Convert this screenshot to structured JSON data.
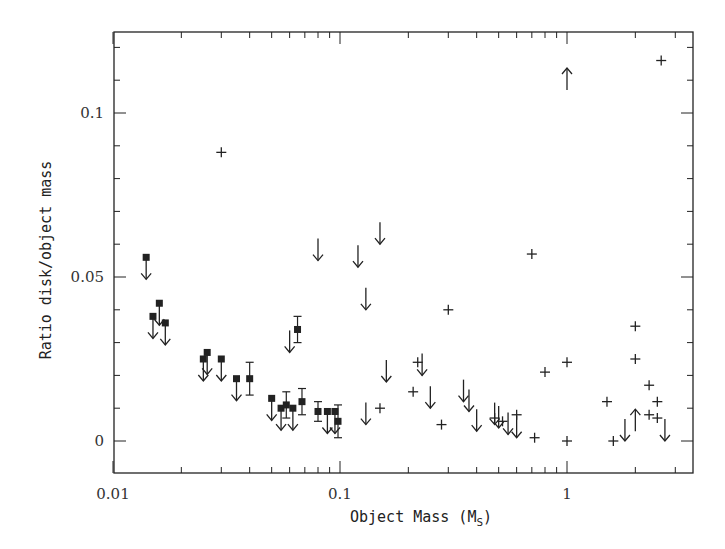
{
  "chart_data": {
    "type": "scatter",
    "title": "",
    "xlabel": "Object Mass (M_S)",
    "ylabel": "Ratio disk/object mass",
    "xscale": "log",
    "xlim": [
      0.01,
      3.6
    ],
    "ylim": [
      -0.01,
      0.125
    ],
    "grid": false,
    "legend": null,
    "x_ticks": [
      "0.01",
      "0.1",
      "1"
    ],
    "y_ticks": [
      "0",
      "0.05",
      "0.1"
    ],
    "series": [
      {
        "name": "detections-upper-limit (filled square + down arrow)",
        "marker": "square-arrow-down",
        "points": [
          [
            0.014,
            0.056
          ],
          [
            0.015,
            0.038
          ],
          [
            0.016,
            0.042
          ],
          [
            0.017,
            0.036
          ],
          [
            0.025,
            0.025
          ],
          [
            0.026,
            0.027
          ],
          [
            0.03,
            0.025
          ],
          [
            0.035,
            0.019
          ],
          [
            0.05,
            0.013
          ],
          [
            0.055,
            0.01
          ],
          [
            0.062,
            0.01
          ],
          [
            0.088,
            0.009
          ],
          [
            0.095,
            0.009
          ]
        ]
      },
      {
        "name": "detections-with-error-bars (filled square)",
        "marker": "square-errorbar",
        "points": [
          [
            0.04,
            0.019,
            0.005
          ],
          [
            0.058,
            0.011,
            0.004
          ],
          [
            0.065,
            0.034,
            0.004
          ],
          [
            0.068,
            0.012,
            0.004
          ],
          [
            0.08,
            0.009,
            0.003
          ],
          [
            0.098,
            0.006,
            0.005
          ]
        ]
      },
      {
        "name": "upper-limits (down arrow)",
        "marker": "arrow-down",
        "points": [
          [
            0.06,
            0.027
          ],
          [
            0.08,
            0.055
          ],
          [
            0.12,
            0.053
          ],
          [
            0.13,
            0.04
          ],
          [
            0.15,
            0.06
          ],
          [
            0.16,
            0.018
          ],
          [
            0.13,
            0.005
          ],
          [
            0.23,
            0.02
          ],
          [
            0.25,
            0.01
          ],
          [
            0.35,
            0.012
          ],
          [
            0.37,
            0.009
          ],
          [
            0.4,
            0.003
          ],
          [
            0.48,
            0.005
          ],
          [
            0.5,
            0.004
          ],
          [
            0.55,
            0.002
          ],
          [
            0.6,
            0.001
          ],
          [
            1.8,
            0.0
          ],
          [
            2.7,
            0.0
          ]
        ]
      },
      {
        "name": "lower-limits (up arrow)",
        "marker": "arrow-up",
        "points": [
          [
            1.0,
            0.107
          ],
          [
            2.0,
            0.003
          ]
        ]
      },
      {
        "name": "measurements (cross)",
        "marker": "plus",
        "points": [
          [
            0.03,
            0.088
          ],
          [
            0.15,
            0.01
          ],
          [
            0.21,
            0.015
          ],
          [
            0.22,
            0.024
          ],
          [
            0.28,
            0.005
          ],
          [
            0.3,
            0.04
          ],
          [
            0.48,
            0.007
          ],
          [
            0.52,
            0.006
          ],
          [
            0.6,
            0.008
          ],
          [
            0.7,
            0.057
          ],
          [
            0.72,
            0.001
          ],
          [
            0.8,
            0.021
          ],
          [
            1.0,
            0.024
          ],
          [
            1.0,
            0.0
          ],
          [
            1.5,
            0.012
          ],
          [
            1.6,
            0.0
          ],
          [
            2.0,
            0.035
          ],
          [
            2.0,
            0.025
          ],
          [
            2.3,
            0.017
          ],
          [
            2.3,
            0.008
          ],
          [
            2.5,
            0.012
          ],
          [
            2.5,
            0.007
          ],
          [
            2.6,
            0.116
          ]
        ]
      }
    ]
  },
  "labels": {
    "xlabel_main": "Object Mass (M",
    "xlabel_sub": "S",
    "xlabel_end": ")",
    "ylabel": "Ratio disk/object mass"
  },
  "style": {
    "ink": "#222222"
  }
}
